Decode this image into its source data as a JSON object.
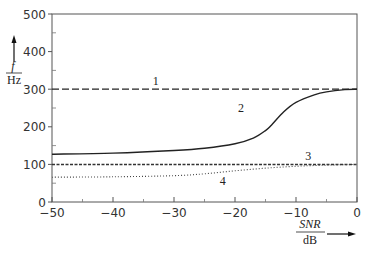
{
  "chart_data": {
    "type": "line",
    "title": "",
    "xlabel": "SNR / dB",
    "ylabel": "f / Hz",
    "xlim": [
      -50,
      0
    ],
    "ylim": [
      0,
      500
    ],
    "xticks": [
      -50,
      -40,
      -30,
      -20,
      -10,
      0
    ],
    "yticks": [
      0,
      100,
      200,
      300,
      400,
      500
    ],
    "grid": false,
    "series": [
      {
        "name": "1",
        "style": "dashed",
        "x": [
          -50,
          0
        ],
        "values": [
          300,
          300
        ]
      },
      {
        "name": "2",
        "style": "solid",
        "x": [
          -50,
          -40,
          -30,
          -25,
          -20,
          -17,
          -15,
          -14,
          -12,
          -10,
          -7,
          -5,
          -2,
          0
        ],
        "values": [
          127,
          130,
          137,
          143,
          155,
          170,
          190,
          205,
          240,
          265,
          285,
          293,
          299,
          300
        ]
      },
      {
        "name": "3",
        "style": "dashed-fine",
        "x": [
          -50,
          0
        ],
        "values": [
          100,
          100
        ]
      },
      {
        "name": "4",
        "style": "dotted",
        "x": [
          -50,
          -40,
          -30,
          -25,
          -20,
          -15,
          -10,
          -5,
          0
        ],
        "values": [
          66,
          67,
          70,
          75,
          83,
          90,
          95,
          98,
          100
        ]
      }
    ],
    "annotations": [
      {
        "text": "1",
        "x": -33,
        "y": 310
      },
      {
        "text": "2",
        "x": -19,
        "y": 240
      },
      {
        "text": "3",
        "x": -8,
        "y": 113
      },
      {
        "text": "4",
        "x": -22,
        "y": 45
      }
    ]
  },
  "axis": {
    "y_label_num": "f",
    "y_label_den": "Hz",
    "x_label_num": "SNR",
    "x_label_den": "dB",
    "xtick_labels": [
      "−50",
      "−40",
      "−30",
      "−20",
      "−10",
      "0"
    ],
    "ytick_labels": [
      "0",
      "100",
      "200",
      "300",
      "400",
      "500"
    ]
  }
}
